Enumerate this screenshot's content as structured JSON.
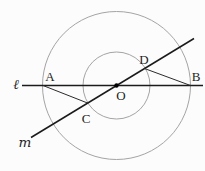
{
  "figure": {
    "kind": "geometry-diagram",
    "labels": {
      "line_l": "ℓ",
      "line_m": "m",
      "point_A": "A",
      "point_B": "B",
      "point_C": "C",
      "point_D": "D",
      "center_O": "O"
    },
    "colors": {
      "background": "#fcfcfc",
      "circle_stroke": "#a4a4a4",
      "line_stroke": "#1b1b1b",
      "segment_stroke": "#2b2b2b",
      "center_dot": "#000000",
      "label_color": "#1e1e1e"
    }
  }
}
